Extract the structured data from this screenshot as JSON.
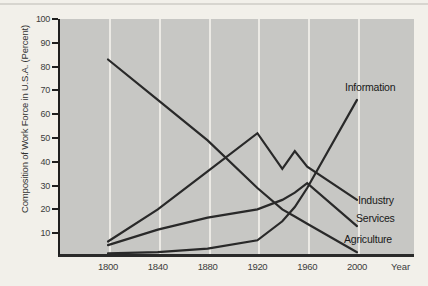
{
  "chart_data": {
    "type": "line",
    "title": "",
    "ylabel": "Composition of Work Force in U.S.A. (Percent)",
    "xlabel": "Year",
    "x": [
      1800,
      1840,
      1880,
      1920,
      1940,
      1950,
      1960,
      2000
    ],
    "x_ticks": [
      1800,
      1840,
      1880,
      1920,
      1960,
      2000
    ],
    "y_ticks": [
      10,
      20,
      30,
      40,
      50,
      60,
      70,
      80,
      90,
      100
    ],
    "ylim": [
      0,
      100
    ],
    "grid": "vertical white gridlines on gray panel, no horizontal gridlines",
    "legend_position": "labels at right ends of lines",
    "series": [
      {
        "name": "Agriculture",
        "values": [
          83,
          66,
          49,
          29,
          20,
          17,
          14,
          2
        ]
      },
      {
        "name": "Industry",
        "values": [
          6.5,
          20,
          36,
          52,
          37,
          44.5,
          38,
          24
        ]
      },
      {
        "name": "Services",
        "values": [
          5,
          11.5,
          16.5,
          20,
          24,
          27,
          31,
          13
        ]
      },
      {
        "name": "Information",
        "values": [
          1.5,
          2,
          3.5,
          7,
          15,
          21,
          29,
          66
        ]
      }
    ],
    "colors": {
      "line": "#292929",
      "panel_background": "#c7c7c4",
      "gridline": "#eceae5",
      "page_background": "#f2f0ea",
      "text": "#3c3c3c"
    }
  }
}
